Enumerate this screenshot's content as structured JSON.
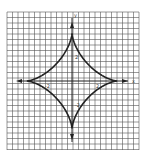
{
  "chart_data": {
    "type": "line",
    "title": "",
    "xlabel": "x",
    "ylabel": "y",
    "curve": "astroid",
    "equation": "x^(2/3) + y^(2/3) = 4^(2/3)",
    "xlim": [
      -6,
      6
    ],
    "ylim": [
      -6.3,
      6.3
    ],
    "grid": true,
    "x_ticks_labeled": [
      "-2",
      "2"
    ],
    "y_ticks_labeled": [
      "2",
      "-2"
    ],
    "series": [
      {
        "name": "astroid",
        "points": [
          [
            4,
            0
          ],
          [
            2.6,
            0.73
          ],
          [
            1.41,
            1.41
          ],
          [
            0.73,
            2.6
          ],
          [
            0,
            4
          ],
          [
            -0.73,
            2.6
          ],
          [
            -1.41,
            1.41
          ],
          [
            -2.6,
            0.73
          ],
          [
            -4,
            0
          ],
          [
            -2.6,
            -0.73
          ],
          [
            -1.41,
            -1.41
          ],
          [
            -0.73,
            -2.6
          ],
          [
            0,
            -4
          ],
          [
            0.73,
            -2.6
          ],
          [
            1.41,
            -1.41
          ],
          [
            2.6,
            -0.73
          ],
          [
            4,
            0
          ]
        ]
      }
    ],
    "legend": null
  },
  "labels": {
    "x_axis": "x",
    "y_axis": "y",
    "x_neg_tick": "-2",
    "x_pos_tick": "2",
    "y_pos_tick": "2",
    "y_neg_tick": "-2"
  },
  "colors": {
    "grid": "#555555",
    "curve": "#222222",
    "background": "#ffffff"
  }
}
